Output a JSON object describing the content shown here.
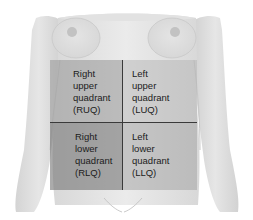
{
  "figure": {
    "colors": {
      "skin_light": "#ececec",
      "skin_mid": "#dcdcdc",
      "skin_shadow": "#c4c4c4",
      "divider": "#3a3a3a",
      "text": "#1c1c1c"
    },
    "quadrants": [
      {
        "id": "ruq",
        "label": "Right\nupper\nquadrant\n(RUQ)",
        "position": "top-left"
      },
      {
        "id": "luq",
        "label": "Left\nupper\nquadrant\n(LUQ)",
        "position": "top-right"
      },
      {
        "id": "rlq",
        "label": "Right\nlower\nquadrant\n(RLQ)",
        "position": "bottom-left"
      },
      {
        "id": "llq",
        "label": "Left\nlower\nquadrant\n(LLQ)",
        "position": "bottom-right"
      }
    ]
  }
}
